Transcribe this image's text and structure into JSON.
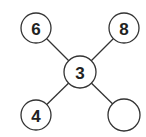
{
  "diagram": {
    "colors": {
      "stroke": "#333333",
      "fill": "#ffffff",
      "text": "#222222"
    },
    "nodes": [
      {
        "id": "top-left",
        "label": "6",
        "cx": 36,
        "cy": 28,
        "r": 15
      },
      {
        "id": "top-right",
        "label": "8",
        "cx": 124,
        "cy": 28,
        "r": 15
      },
      {
        "id": "center",
        "label": "3",
        "cx": 80,
        "cy": 72,
        "r": 16
      },
      {
        "id": "bottom-left",
        "label": "4",
        "cx": 36,
        "cy": 115,
        "r": 15
      },
      {
        "id": "bottom-right",
        "label": "",
        "cx": 124,
        "cy": 115,
        "r": 16
      }
    ],
    "edges": [
      {
        "from": "center",
        "to": "top-left"
      },
      {
        "from": "center",
        "to": "top-right"
      },
      {
        "from": "center",
        "to": "bottom-left"
      },
      {
        "from": "center",
        "to": "bottom-right"
      }
    ]
  }
}
